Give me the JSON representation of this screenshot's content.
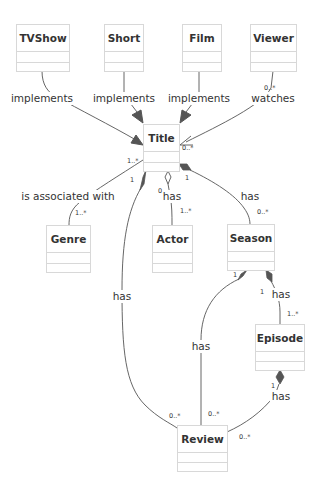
{
  "diagram": {
    "type": "uml-class-diagram",
    "classes": [
      {
        "id": "tvshow",
        "name": "TVShow"
      },
      {
        "id": "short",
        "name": "Short"
      },
      {
        "id": "film",
        "name": "Film"
      },
      {
        "id": "viewer",
        "name": "Viewer"
      },
      {
        "id": "title",
        "name": "Title"
      },
      {
        "id": "genre",
        "name": "Genre"
      },
      {
        "id": "actor",
        "name": "Actor"
      },
      {
        "id": "season",
        "name": "Season"
      },
      {
        "id": "episode",
        "name": "Episode"
      },
      {
        "id": "review",
        "name": "Review"
      }
    ],
    "relations": [
      {
        "from": "TVShow",
        "to": "Title",
        "label": "implements",
        "kind": "association-arrow"
      },
      {
        "from": "Short",
        "to": "Title",
        "label": "implements",
        "kind": "association-arrow"
      },
      {
        "from": "Film",
        "to": "Title",
        "label": "implements",
        "kind": "association-arrow"
      },
      {
        "from": "Viewer",
        "to": "Title",
        "label": "watches",
        "kind": "association-arrow",
        "from_card": "0..*",
        "to_card": "0..*"
      },
      {
        "from": "Title",
        "to": "Genre",
        "label": "is associated with",
        "kind": "association",
        "from_card": "1..*",
        "to_card": "1..*"
      },
      {
        "from": "Title",
        "to": "Actor",
        "label": "has",
        "kind": "aggregation",
        "from_card": "0",
        "to_card": "1..*"
      },
      {
        "from": "Title",
        "to": "Season",
        "label": "has",
        "kind": "composition",
        "from_card": "1",
        "to_card": "0..*"
      },
      {
        "from": "Title",
        "to": "Review",
        "label": "has",
        "kind": "composition",
        "from_card": "1",
        "to_card": "0..*"
      },
      {
        "from": "Season",
        "to": "Episode",
        "label": "has",
        "kind": "composition",
        "from_card": "1",
        "to_card": "1..*"
      },
      {
        "from": "Season",
        "to": "Review",
        "label": "has",
        "kind": "composition",
        "from_card": "1",
        "to_card": "0..*"
      },
      {
        "from": "Episode",
        "to": "Review",
        "label": "has",
        "kind": "composition",
        "from_card": "1",
        "to_card": "0..*"
      }
    ]
  },
  "labels": {
    "tvshow_title": "implements",
    "short_title": "implements",
    "film_title": "implements",
    "viewer_title": "watches",
    "title_genre": "is associated with",
    "title_actor": "has",
    "title_season": "has",
    "title_review": "has",
    "season_episode": "has",
    "season_review": "has",
    "episode_review": "has"
  },
  "cardinalities": {
    "viewer_from": "0..*",
    "viewer_to": "0..*",
    "genre_from": "1..*",
    "genre_to": "1..*",
    "actor_from": "0",
    "actor_to": "1..*",
    "season_from": "1",
    "season_to": "0..*",
    "review_title_from": "1",
    "review_title_to": "0..*",
    "episode_from": "1",
    "episode_to": "1..*",
    "review_season_from": "1",
    "review_season_to": "0..*",
    "review_episode_from": "1",
    "review_episode_to": "0..*"
  },
  "colors": {
    "background": "#ffffff",
    "box_border": "#d8d8d8",
    "edge": "#555555",
    "text": "#333333"
  }
}
